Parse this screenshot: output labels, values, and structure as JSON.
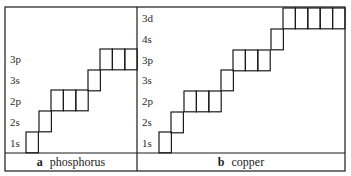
{
  "colors": {
    "line": "#1a1a1a",
    "text": "#2a2a2a",
    "background": "#ffffff"
  },
  "panels": [
    {
      "id": "a",
      "letter": "a",
      "name": "phosphorus",
      "levels": [
        {
          "label": "3p",
          "y": 59
        },
        {
          "label": "3s",
          "y": 80
        },
        {
          "label": "2p",
          "y": 101
        },
        {
          "label": "2s",
          "y": 122
        },
        {
          "label": "1s",
          "y": 143
        }
      ],
      "orbitals": [
        {
          "level": "1s",
          "x": 26,
          "y": 132,
          "boxes": 1
        },
        {
          "level": "2s",
          "x": 39,
          "y": 111,
          "boxes": 1
        },
        {
          "level": "2p",
          "x": 51,
          "y": 90,
          "boxes": 3
        },
        {
          "level": "3s",
          "x": 88,
          "y": 70,
          "boxes": 1
        },
        {
          "level": "3p",
          "x": 100,
          "y": 49,
          "boxes": 3
        }
      ]
    },
    {
      "id": "b",
      "letter": "b",
      "name": "copper",
      "levels": [
        {
          "label": "3d",
          "y": 18
        },
        {
          "label": "4s",
          "y": 39
        },
        {
          "label": "3p",
          "y": 60
        },
        {
          "label": "3s",
          "y": 80
        },
        {
          "label": "2p",
          "y": 101
        },
        {
          "label": "2s",
          "y": 122
        },
        {
          "label": "1s",
          "y": 143
        }
      ],
      "orbitals": [
        {
          "level": "1s",
          "x": 159,
          "y": 132,
          "boxes": 1
        },
        {
          "level": "2s",
          "x": 171,
          "y": 112,
          "boxes": 1
        },
        {
          "level": "2p",
          "x": 184,
          "y": 91,
          "boxes": 3
        },
        {
          "level": "3s",
          "x": 221,
          "y": 70,
          "boxes": 1
        },
        {
          "level": "3p",
          "x": 233,
          "y": 50,
          "boxes": 3
        },
        {
          "level": "4s",
          "x": 271,
          "y": 29,
          "boxes": 1
        },
        {
          "level": "3d",
          "x": 283,
          "y": 8,
          "boxes": 5
        }
      ]
    }
  ],
  "layout": {
    "frame": {
      "x": 5,
      "y": 7,
      "w": 340,
      "h": 164
    },
    "divider_x": 137,
    "caption_row_y": 153,
    "box_w": 12.4,
    "box_h": 20.8
  }
}
